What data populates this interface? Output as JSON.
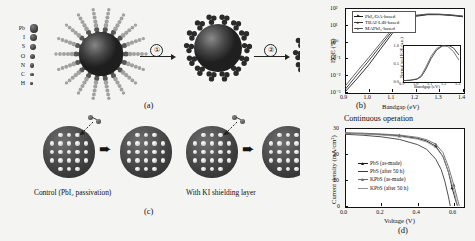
{
  "figure": {
    "panels": [
      {
        "tag": "(a)"
      },
      {
        "tag": "(b)"
      },
      {
        "tag": "(c)"
      },
      {
        "tag": "(d)"
      }
    ]
  },
  "panel_a": {
    "tag": "(a)",
    "atom_legend": [
      {
        "label": "Pb",
        "size": 8.4
      },
      {
        "label": "I",
        "size": 7.4
      },
      {
        "label": "S",
        "size": 6.2
      },
      {
        "label": "O",
        "size": 5.2
      },
      {
        "label": "N",
        "size": 4.4
      },
      {
        "label": "C",
        "size": 3.6
      },
      {
        "label": "H",
        "size": 2.6
      }
    ],
    "steps": [
      {
        "number": "①"
      },
      {
        "number": "②"
      }
    ]
  },
  "panel_c": {
    "tag": "(c)",
    "left_label": "Control (PbI₂ passivation)",
    "right_label": "With KI shielding layer"
  },
  "panel_b": {
    "tag": "(b)"
  },
  "panel_d": {
    "tag": "(d)",
    "header": "Continuous operation"
  },
  "chart_data": [
    {
      "id": "eqe-bandgap",
      "type": "line",
      "title": "",
      "xlabel": "Bandgap (eV)",
      "ylabel": "EQE (%)",
      "xlim": [
        0.9,
        1.4
      ],
      "ylim": [
        0.001,
        100
      ],
      "yscale": "log",
      "xticks": [
        "0.9",
        "1.0",
        "1.1",
        "1.2",
        "1.3",
        "1.4"
      ],
      "yticks": [
        "10²",
        "10¹",
        "10⁰",
        "10⁻¹",
        "10⁻²",
        "10⁻³"
      ],
      "grid": false,
      "legend_position": "top-left",
      "series": [
        {
          "name": "PbI₂/OA-based",
          "color": "#1a1a1a",
          "x": [
            0.9,
            0.95,
            1.0,
            1.05,
            1.1,
            1.15,
            1.2,
            1.25,
            1.3,
            1.35,
            1.4
          ],
          "y": [
            0.0009,
            0.006,
            0.04,
            0.35,
            3.0,
            16.0,
            32.0,
            40.0,
            40.0,
            36.0,
            30.0
          ]
        },
        {
          "name": "TBAI-LiB-based",
          "color": "#333333",
          "x": [
            0.9,
            0.95,
            1.0,
            1.05,
            1.1,
            1.15,
            1.2,
            1.25,
            1.3,
            1.35,
            1.4
          ],
          "y": [
            0.0014,
            0.01,
            0.07,
            0.55,
            4.2,
            19.0,
            35.0,
            42.0,
            42.0,
            38.0,
            32.0
          ]
        },
        {
          "name": "MAPbI₃-based",
          "color": "#555555",
          "x": [
            0.9,
            0.95,
            1.0,
            1.05,
            1.1,
            1.15,
            1.2,
            1.25,
            1.3,
            1.35,
            1.4
          ],
          "y": [
            0.0022,
            0.016,
            0.11,
            0.8,
            5.5,
            22.0,
            37.0,
            44.0,
            43.0,
            39.0,
            33.0
          ]
        }
      ],
      "inset": {
        "type": "line",
        "xlabel": "Bandgap (eV)",
        "ylabel": "Normalized EQE (a.u.)",
        "xlim": [
          0.9,
          1.3
        ],
        "ylim": [
          0.0,
          1.0
        ],
        "xticks": [
          "0.9",
          "1.0",
          "1.1",
          "1.2",
          "1.3"
        ],
        "yticks": [
          "0.0",
          "0.5",
          "1.0"
        ],
        "series": [
          {
            "name": "curve-1",
            "color": "#1a1a1a",
            "x": [
              0.9,
              0.95,
              1.0,
              1.03,
              1.06,
              1.1,
              1.14,
              1.18,
              1.22,
              1.26,
              1.3
            ],
            "y": [
              0.01,
              0.02,
              0.05,
              0.12,
              0.3,
              0.62,
              0.86,
              0.97,
              1.0,
              0.92,
              0.72
            ]
          },
          {
            "name": "curve-2",
            "color": "#555555",
            "x": [
              0.9,
              0.95,
              1.0,
              1.03,
              1.06,
              1.1,
              1.14,
              1.18,
              1.22,
              1.26,
              1.3
            ],
            "y": [
              0.01,
              0.02,
              0.06,
              0.15,
              0.36,
              0.68,
              0.9,
              0.98,
              0.96,
              0.82,
              0.58
            ]
          }
        ]
      }
    },
    {
      "id": "jv-curves",
      "type": "line",
      "title": "Continuous operation",
      "xlabel": "Voltage (V)",
      "ylabel": "Current density (mA/cm²)",
      "xlim": [
        0.0,
        0.65
      ],
      "ylim": [
        0,
        30
      ],
      "xticks": [
        "0.0",
        "0.2",
        "0.4",
        "0.6"
      ],
      "yticks": [
        "0",
        "10",
        "20",
        "30"
      ],
      "grid": false,
      "legend_position": "center-left",
      "series": [
        {
          "name": "PbS (as-made)",
          "color": "#1a1a1a",
          "marker": "triangle",
          "x": [
            0.0,
            0.1,
            0.2,
            0.3,
            0.4,
            0.45,
            0.5,
            0.54,
            0.57,
            0.59,
            0.61,
            0.62
          ],
          "y": [
            28.0,
            27.8,
            27.5,
            27.0,
            26.0,
            25.0,
            23.0,
            19.0,
            13.0,
            7.0,
            2.0,
            0.0
          ]
        },
        {
          "name": "PbS (after 50 h)",
          "color": "#3c3c3c",
          "marker": "line",
          "x": [
            0.0,
            0.1,
            0.2,
            0.3,
            0.4,
            0.45,
            0.5,
            0.53,
            0.55,
            0.57,
            0.58
          ],
          "y": [
            27.6,
            27.2,
            26.6,
            25.6,
            23.6,
            21.8,
            18.0,
            14.0,
            9.5,
            3.5,
            0.0
          ]
        },
        {
          "name": "KPbS (as-made)",
          "color": "#6b6b6b",
          "marker": "triangle",
          "x": [
            0.0,
            0.1,
            0.2,
            0.3,
            0.4,
            0.45,
            0.5,
            0.54,
            0.57,
            0.6,
            0.62,
            0.63
          ],
          "y": [
            28.2,
            28.0,
            27.7,
            27.3,
            26.4,
            25.5,
            23.8,
            20.5,
            15.0,
            8.0,
            2.5,
            0.0
          ]
        },
        {
          "name": "KPbS (after 50 h)",
          "color": "#8f8f8f",
          "marker": "line",
          "x": [
            0.0,
            0.1,
            0.2,
            0.3,
            0.4,
            0.45,
            0.5,
            0.54,
            0.57,
            0.6,
            0.62
          ],
          "y": [
            28.0,
            27.7,
            27.3,
            26.8,
            25.7,
            24.6,
            22.6,
            19.0,
            13.0,
            6.0,
            0.0
          ]
        }
      ]
    }
  ]
}
